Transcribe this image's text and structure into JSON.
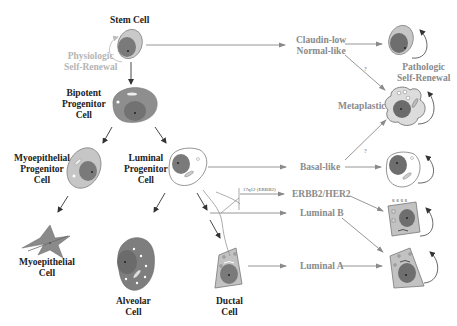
{
  "normal_hierarchy": {
    "stem_cell": {
      "label": "Stem Cell"
    },
    "physiologic_self_renewal": {
      "line1": "Physiologic",
      "line2": "Self-Renewal"
    },
    "bipotent_progenitor": {
      "line1": "Bipotent",
      "line2": "Progenitor",
      "line3": "Cell"
    },
    "myoepithelial_progenitor": {
      "line1": "Myoepithelial",
      "line2": "Progenitor",
      "line3": "Cell"
    },
    "luminal_progenitor": {
      "line1": "Luminal",
      "line2": "Progenitor",
      "line3": "Cell"
    },
    "myoepithelial_cell": {
      "line1": "Myoepithelial",
      "line2": "Cell"
    },
    "alveolar_cell": {
      "line1": "Alveolar",
      "line2": "Cell"
    },
    "ductal_cell": {
      "line1": "Ductal",
      "line2": "Cell"
    }
  },
  "subtypes": {
    "claudin_low": {
      "line1": "Claudin-low",
      "line2": "Normal-like"
    },
    "basal_like": {
      "label": "Basal-like"
    },
    "erbb2": {
      "label": "ERBB2/HER2"
    },
    "luminal_b": {
      "label": "Luminal B"
    },
    "luminal_a": {
      "label": "Luminal A"
    },
    "metaplastic": {
      "label": "Metaplastic"
    }
  },
  "annotations": {
    "amplicon": "17q12 (ERBB2)",
    "question_mark_1": "?",
    "question_mark_2": "?",
    "pathologic_self_renewal": {
      "line1": "Pathologic",
      "line2": "Self-Renewal"
    }
  },
  "colors": {
    "cell_fill_dark": "#8c8c8c",
    "cell_fill_light": "#c8c8c8",
    "nucleus": "#6e6e6e",
    "arrow_black": "#333333",
    "arrow_grey": "#8a8a8a",
    "text_grey": "#8a8a8a",
    "text_light": "#b5b5b5"
  }
}
